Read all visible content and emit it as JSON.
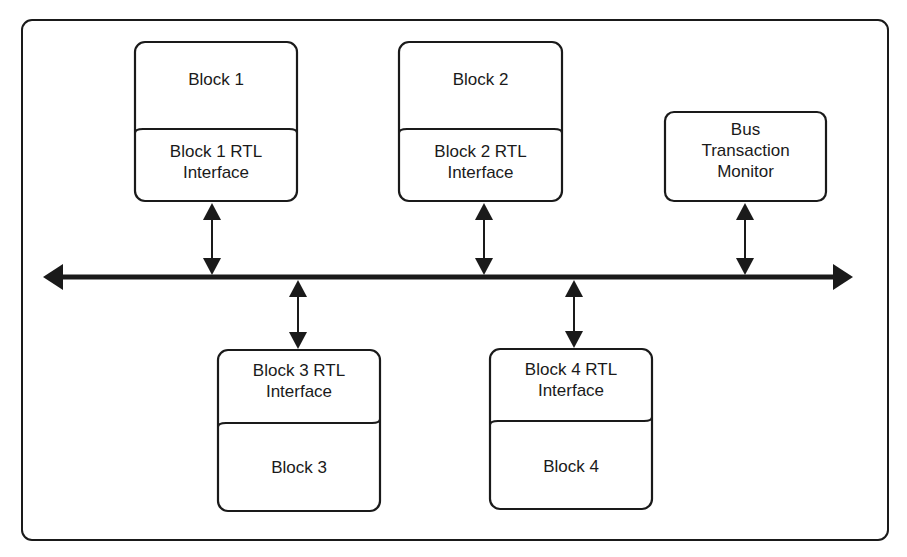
{
  "diagram": {
    "type": "bus-architecture",
    "blocks": [
      {
        "id": "block1",
        "title": "Block 1",
        "interface": "Block 1 RTL\nInterface",
        "position": "top"
      },
      {
        "id": "block2",
        "title": "Block 2",
        "interface": "Block 2 RTL\nInterface",
        "position": "top"
      },
      {
        "id": "block3",
        "title": "Block 3",
        "interface": "Block 3 RTL\nInterface",
        "position": "bottom"
      },
      {
        "id": "block4",
        "title": "Block 4",
        "interface": "Block 4 RTL\nInterface",
        "position": "bottom"
      }
    ],
    "monitor": {
      "label": "Bus\nTransaction\nMonitor",
      "position": "top"
    },
    "bus": {
      "direction": "bidirectional",
      "connections": [
        "block1",
        "block2",
        "monitor",
        "block3",
        "block4"
      ]
    },
    "colors": {
      "stroke": "#1a1a1a",
      "background": "#ffffff"
    }
  }
}
